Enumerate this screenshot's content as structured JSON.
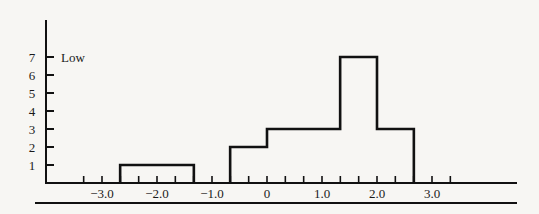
{
  "chart_data": {
    "type": "bar",
    "subtype": "histogram",
    "title": "",
    "xlabel": "",
    "ylabel": "",
    "annotation": "Low",
    "annotation_at_y": 7,
    "x_ticks_labeled": [
      -3.0,
      -2.0,
      -1.0,
      0,
      1.0,
      2.0,
      3.0
    ],
    "x_tick_labels": [
      "−3.0",
      "−2.0",
      "−1.0",
      "0",
      "1.0",
      "2.0",
      "3.0"
    ],
    "x_minor_tick_step": 0.333,
    "y_ticks": [
      1,
      2,
      3,
      4,
      5,
      6,
      7
    ],
    "y_tick_labels": [
      "1",
      "2",
      "3",
      "4",
      "5",
      "6",
      "7"
    ],
    "xlim": [
      -3.8,
      4.6
    ],
    "ylim": [
      0,
      8.9
    ],
    "grid": false,
    "legend": null,
    "bins": [
      {
        "x0": -2.67,
        "x1": -1.33,
        "value": 1
      },
      {
        "x0": -0.67,
        "x1": 0.0,
        "value": 2
      },
      {
        "x0": 0.0,
        "x1": 1.33,
        "value": 3
      },
      {
        "x0": 1.33,
        "x1": 2.0,
        "value": 7
      },
      {
        "x0": 2.0,
        "x1": 2.67,
        "value": 3
      }
    ],
    "categories": [
      "-2.67 to -1.33",
      "-0.67 to 0",
      "0 to 1.33",
      "1.33 to 2.0",
      "2.0 to 2.67"
    ],
    "values": [
      1,
      2,
      3,
      7,
      3
    ]
  },
  "colors": {
    "ink": "#111111",
    "background": "#f7f6f3"
  }
}
